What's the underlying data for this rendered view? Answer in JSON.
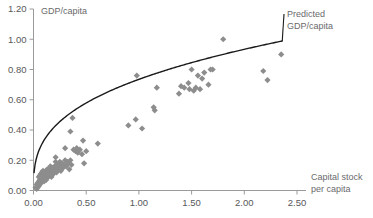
{
  "chart_data": {
    "type": "scatter",
    "title": "",
    "xlabel": "Capital stock per capita",
    "ylabel": "GDP/capita",
    "xlim": [
      0.0,
      2.5
    ],
    "ylim": [
      0.0,
      1.2
    ],
    "grid": false,
    "xticks": [
      "0.00",
      "0.50",
      "1.00",
      "1.50",
      "2.00",
      "2.50"
    ],
    "xtick_values": [
      0.0,
      0.5,
      1.0,
      1.5,
      2.0,
      2.5
    ],
    "yticks": [
      "0.00",
      "0.20",
      "0.40",
      "0.60",
      "0.80",
      "1.00",
      "1.20"
    ],
    "ytick_values": [
      0.0,
      0.2,
      0.4,
      0.6,
      0.8,
      1.0,
      1.2
    ],
    "marker_color": "#8d8d8d",
    "marker_shape": "diamond",
    "curve_color": "#1a1a1a",
    "annotations": [
      {
        "name": "predicted-curve-label",
        "text": "Predicted GDP/capita",
        "line1": "Predicted",
        "line2": "GDP/capita"
      }
    ],
    "series": [
      {
        "name": "Countries",
        "type": "scatter",
        "points": [
          [
            0.02,
            0.02
          ],
          [
            0.03,
            0.01
          ],
          [
            0.03,
            0.04
          ],
          [
            0.04,
            0.02
          ],
          [
            0.04,
            0.05
          ],
          [
            0.05,
            0.03
          ],
          [
            0.05,
            0.06
          ],
          [
            0.05,
            0.09
          ],
          [
            0.06,
            0.04
          ],
          [
            0.06,
            0.07
          ],
          [
            0.06,
            0.1
          ],
          [
            0.07,
            0.05
          ],
          [
            0.07,
            0.08
          ],
          [
            0.07,
            0.11
          ],
          [
            0.08,
            0.06
          ],
          [
            0.08,
            0.09
          ],
          [
            0.08,
            0.12
          ],
          [
            0.09,
            0.07
          ],
          [
            0.09,
            0.1
          ],
          [
            0.09,
            0.13
          ],
          [
            0.1,
            0.08
          ],
          [
            0.1,
            0.11
          ],
          [
            0.1,
            0.06
          ],
          [
            0.11,
            0.09
          ],
          [
            0.11,
            0.12
          ],
          [
            0.12,
            0.1
          ],
          [
            0.12,
            0.13
          ],
          [
            0.12,
            0.07
          ],
          [
            0.13,
            0.11
          ],
          [
            0.13,
            0.14
          ],
          [
            0.14,
            0.09
          ],
          [
            0.14,
            0.12
          ],
          [
            0.15,
            0.1
          ],
          [
            0.15,
            0.14
          ],
          [
            0.16,
            0.11
          ],
          [
            0.16,
            0.16
          ],
          [
            0.17,
            0.13
          ],
          [
            0.17,
            0.09
          ],
          [
            0.18,
            0.12
          ],
          [
            0.18,
            0.15
          ],
          [
            0.19,
            0.14
          ],
          [
            0.19,
            0.11
          ],
          [
            0.2,
            0.16
          ],
          [
            0.2,
            0.13
          ],
          [
            0.21,
            0.19
          ],
          [
            0.21,
            0.22
          ],
          [
            0.22,
            0.15
          ],
          [
            0.22,
            0.12
          ],
          [
            0.23,
            0.17
          ],
          [
            0.24,
            0.14
          ],
          [
            0.25,
            0.16
          ],
          [
            0.25,
            0.19
          ],
          [
            0.26,
            0.13
          ],
          [
            0.27,
            0.18
          ],
          [
            0.28,
            0.15
          ],
          [
            0.29,
            0.17
          ],
          [
            0.3,
            0.2
          ],
          [
            0.3,
            0.28
          ],
          [
            0.31,
            0.16
          ],
          [
            0.32,
            0.19
          ],
          [
            0.33,
            0.18
          ],
          [
            0.34,
            0.14
          ],
          [
            0.35,
            0.2
          ],
          [
            0.35,
            0.39
          ],
          [
            0.36,
            0.17
          ],
          [
            0.37,
            0.48
          ],
          [
            0.38,
            0.27
          ],
          [
            0.4,
            0.26
          ],
          [
            0.41,
            0.28
          ],
          [
            0.42,
            0.25
          ],
          [
            0.44,
            0.27
          ],
          [
            0.46,
            0.24
          ],
          [
            0.47,
            0.33
          ],
          [
            0.48,
            0.18
          ],
          [
            0.5,
            0.26
          ],
          [
            0.61,
            0.31
          ],
          [
            0.9,
            0.43
          ],
          [
            0.97,
            0.47
          ],
          [
            0.98,
            0.76
          ],
          [
            1.03,
            0.41
          ],
          [
            1.14,
            0.55
          ],
          [
            1.15,
            0.53
          ],
          [
            1.17,
            0.68
          ],
          [
            1.38,
            0.64
          ],
          [
            1.4,
            0.69
          ],
          [
            1.43,
            0.68
          ],
          [
            1.47,
            0.71
          ],
          [
            1.48,
            0.67
          ],
          [
            1.5,
            0.8
          ],
          [
            1.52,
            0.66
          ],
          [
            1.54,
            0.68
          ],
          [
            1.56,
            0.76
          ],
          [
            1.58,
            0.67
          ],
          [
            1.6,
            0.74
          ],
          [
            1.62,
            0.78
          ],
          [
            1.66,
            0.7
          ],
          [
            1.68,
            0.8
          ],
          [
            1.7,
            0.8
          ],
          [
            1.8,
            1.0
          ],
          [
            2.18,
            0.79
          ],
          [
            2.22,
            0.73
          ],
          [
            2.35,
            0.9
          ]
        ]
      },
      {
        "name": "Predicted GDP/capita",
        "type": "line",
        "function": "y = 0.735 * x^0.345",
        "x_start": 0.005,
        "x_end": 2.36,
        "y_start": 0.15,
        "y_end": 1.1
      }
    ]
  }
}
